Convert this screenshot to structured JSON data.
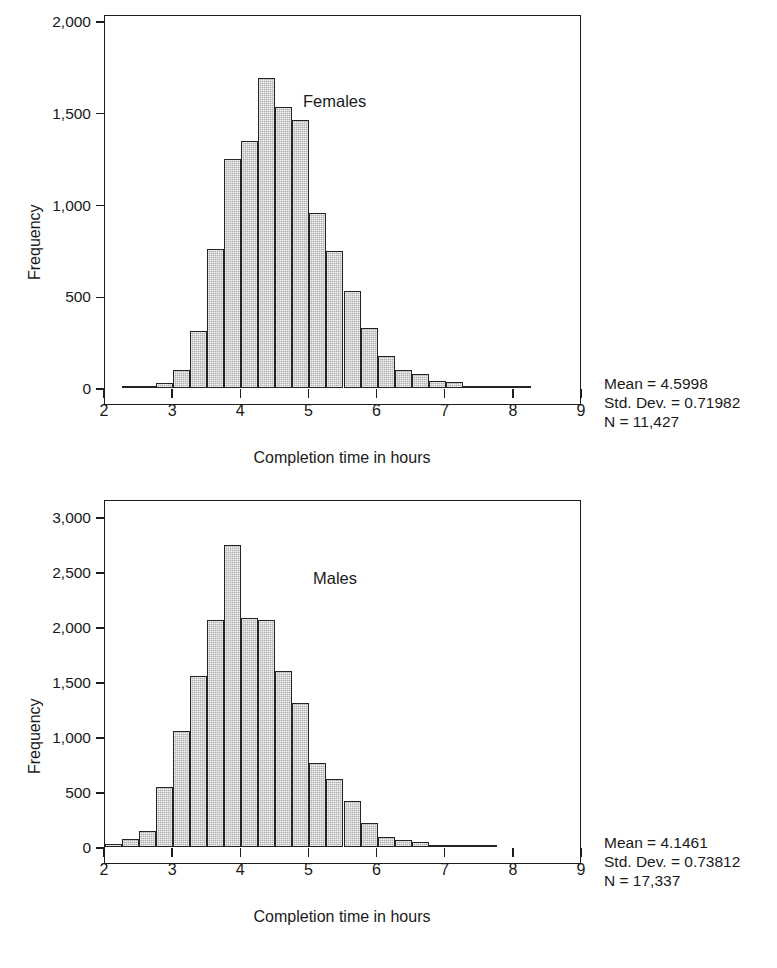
{
  "figure": {
    "background": "#ffffff",
    "bar_fill": "#b0b0b0",
    "bar_stroke": "#242424",
    "axis_color": "#1d1d1d"
  },
  "chart_data": [
    {
      "id": "females",
      "type": "bar",
      "title": "",
      "annotation": "Females",
      "xlabel": "Completion time in hours",
      "ylabel": "Frequency",
      "xlim": [
        2,
        9
      ],
      "ylim": [
        0,
        2000
      ],
      "xticks": [
        "2",
        "3",
        "4",
        "5",
        "6",
        "7",
        "8",
        "9"
      ],
      "xtick_values": [
        2,
        3,
        4,
        5,
        6,
        7,
        8,
        9
      ],
      "yticks": [
        "0",
        "500",
        "1,000",
        "1,500",
        "2,000"
      ],
      "ytick_values": [
        0,
        500,
        1000,
        1500,
        2000
      ],
      "grid": false,
      "bin_width": 0.25,
      "bin_starts": [
        2.0,
        2.25,
        2.5,
        2.75,
        3.0,
        3.25,
        3.5,
        3.75,
        4.0,
        4.25,
        4.5,
        4.75,
        5.0,
        5.25,
        5.5,
        5.75,
        6.0,
        6.25,
        6.5,
        6.75,
        7.0,
        7.25,
        7.5,
        7.75,
        8.0,
        8.25,
        8.5,
        8.75
      ],
      "values": [
        0,
        4,
        10,
        30,
        100,
        310,
        760,
        1250,
        1345,
        1690,
        1530,
        1460,
        955,
        745,
        530,
        325,
        175,
        100,
        75,
        40,
        35,
        12,
        6,
        3,
        1,
        0,
        0,
        0
      ],
      "stats": {
        "mean_label": "Mean = 4.5998",
        "std_label": "Std. Dev. = 0.71982",
        "n_label": "N = 11,427",
        "mean": 4.5998,
        "std_dev": 0.71982,
        "n": "11,427"
      }
    },
    {
      "id": "males",
      "type": "bar",
      "title": "",
      "annotation": "Males",
      "xlabel": "Completion time in hours",
      "ylabel": "Frequency",
      "xlim": [
        2,
        9
      ],
      "ylim": [
        0,
        3000
      ],
      "xticks": [
        "2",
        "3",
        "4",
        "5",
        "6",
        "7",
        "8",
        "9"
      ],
      "xtick_values": [
        2,
        3,
        4,
        5,
        6,
        7,
        8,
        9
      ],
      "yticks": [
        "0",
        "500",
        "1,000",
        "1,500",
        "2,000",
        "2,500",
        "3,000"
      ],
      "ytick_values": [
        0,
        500,
        1000,
        1500,
        2000,
        2500,
        3000
      ],
      "grid": false,
      "bin_width": 0.25,
      "bin_starts": [
        2.0,
        2.25,
        2.5,
        2.75,
        3.0,
        3.25,
        3.5,
        3.75,
        4.0,
        4.25,
        4.5,
        4.75,
        5.0,
        5.25,
        5.5,
        5.75,
        6.0,
        6.25,
        6.5,
        6.75,
        7.0,
        7.25,
        7.5,
        7.75,
        8.0,
        8.25,
        8.5,
        8.75
      ],
      "values": [
        25,
        70,
        150,
        545,
        1055,
        1555,
        2065,
        2745,
        2085,
        2060,
        1600,
        1305,
        760,
        620,
        420,
        215,
        95,
        60,
        45,
        18,
        8,
        3,
        1,
        0,
        0,
        0,
        0,
        0
      ],
      "stats": {
        "mean_label": "Mean = 4.1461",
        "std_label": "Std. Dev. = 0.73812",
        "n_label": "N = 17,337",
        "mean": 4.1461,
        "std_dev": 0.73812,
        "n": "17,337"
      }
    }
  ]
}
